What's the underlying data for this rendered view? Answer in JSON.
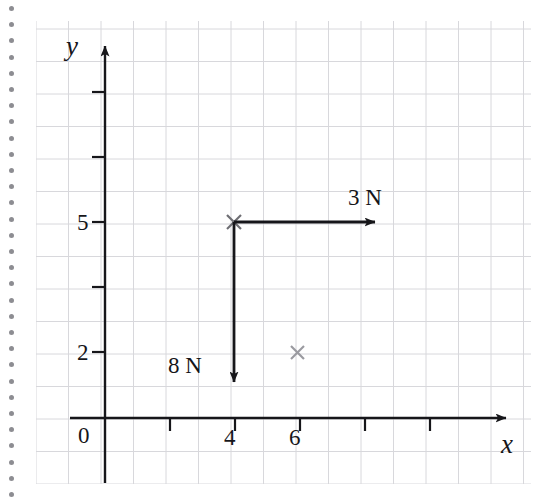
{
  "page": {
    "kind": "graph-paper-diagram",
    "background_color": "#ffffff",
    "ink_color": "#16161a",
    "grid_color": "#d8d8dc",
    "binding_dot_color": "#8d8d92",
    "binding_dot_count": 31
  },
  "axes": {
    "x_axis_label": "x",
    "y_axis_label": "y",
    "origin_label": "0",
    "x_tick_labels": [
      "4",
      "6"
    ],
    "y_tick_labels": [
      "5",
      "2"
    ]
  },
  "markers": [
    {
      "name": "point-4-5",
      "label": "",
      "glyph": "x",
      "x": 4,
      "y": 5
    },
    {
      "name": "point-6-2",
      "label": "",
      "glyph": "x",
      "x": 6,
      "y": 2
    }
  ],
  "forces": [
    {
      "name": "force-right",
      "label": "3 N",
      "magnitude": 3,
      "unit": "N",
      "direction": "right",
      "from": {
        "x": 4,
        "y": 5
      },
      "to": {
        "x": 8.4,
        "y": 5
      }
    },
    {
      "name": "force-down",
      "label": "8 N",
      "magnitude": 8,
      "unit": "N",
      "direction": "down",
      "from": {
        "x": 4,
        "y": 5
      },
      "to": {
        "x": 4,
        "y": 0.9
      }
    }
  ],
  "chart_data": {
    "type": "scatter",
    "title": "",
    "xlabel": "x",
    "ylabel": "y",
    "grid": true,
    "legend": "none",
    "xlim": [
      0,
      14
    ],
    "ylim": [
      0,
      12
    ],
    "x_ticks": [
      2,
      4,
      6,
      8,
      10,
      12
    ],
    "x_tick_labels": [
      "",
      "4",
      "6",
      "",
      "",
      ""
    ],
    "y_ticks": [
      2,
      4,
      6,
      8
    ],
    "y_tick_labels": [
      "2",
      "",
      "5",
      ""
    ],
    "points": [
      {
        "x": 4,
        "y": 5,
        "marker": "x"
      },
      {
        "x": 6,
        "y": 2,
        "marker": "x"
      }
    ],
    "annotations": [
      {
        "text": "3 N",
        "type": "arrow",
        "start": [
          4,
          5
        ],
        "end": [
          8.4,
          5
        ]
      },
      {
        "text": "8 N",
        "type": "arrow",
        "start": [
          4,
          5
        ],
        "end": [
          4,
          0.9
        ]
      }
    ]
  }
}
